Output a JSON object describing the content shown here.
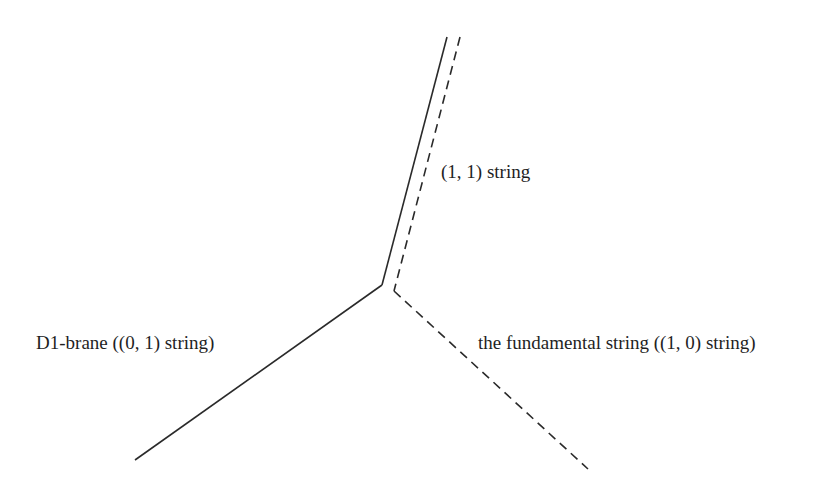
{
  "diagram": {
    "type": "string-junction",
    "labels": {
      "string_11": "(1, 1) string",
      "d1_brane": "D1-brane ((0, 1) string)",
      "fundamental": "the fundamental string ((1, 0) string)"
    },
    "colors": {
      "line": "#2a2a2a",
      "text": "#1f1f1f",
      "background": "#ffffff"
    },
    "strokes": {
      "solid": "D1-brane and (1,1) string (solid)",
      "dashed": "fundamental string and (1,1) string (dashed)"
    }
  }
}
